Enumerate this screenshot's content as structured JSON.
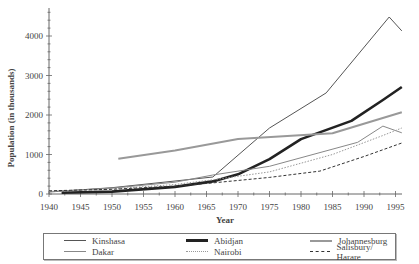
{
  "chart_data": {
    "type": "line",
    "title": "",
    "xlabel": "Year",
    "ylabel": "Population (in thousands)",
    "xlim": [
      1940,
      1996
    ],
    "ylim": [
      0,
      4650
    ],
    "xticks": [
      1940,
      1945,
      1950,
      1955,
      1960,
      1965,
      1970,
      1975,
      1980,
      1985,
      1990,
      1995
    ],
    "yticks": [
      0,
      1000,
      2000,
      3000,
      4000
    ],
    "grid": false,
    "legend_position": "bottom",
    "series": [
      {
        "name": "Kinshasa",
        "color": "#555555",
        "style": "solid-thin",
        "x": [
          1940,
          1950,
          1960,
          1966,
          1975,
          1984,
          1994,
          1996
        ],
        "y": [
          50,
          160,
          330,
          430,
          1670,
          2560,
          4480,
          4130
        ]
      },
      {
        "name": "Abidjan",
        "color": "#222222",
        "style": "solid-thick",
        "x": [
          1942,
          1950,
          1960,
          1966,
          1970,
          1975,
          1980,
          1988,
          1993,
          1996
        ],
        "y": [
          30,
          60,
          180,
          320,
          500,
          880,
          1390,
          1850,
          2380,
          2710
        ]
      },
      {
        "name": "Johannesburg",
        "color": "#999999",
        "style": "solid-medium",
        "x": [
          1951,
          1960,
          1970,
          1985,
          1996
        ],
        "y": [
          890,
          1100,
          1390,
          1540,
          2070
        ]
      },
      {
        "name": "Dakar",
        "color": "#888888",
        "style": "solid-thin",
        "x": [
          1940,
          1950,
          1960,
          1966,
          1975,
          1989,
          1993,
          1996
        ],
        "y": [
          60,
          150,
          300,
          480,
          700,
          1310,
          1720,
          1550
        ]
      },
      {
        "name": "Nairobi",
        "color": "#999999",
        "style": "dotted",
        "x": [
          1940,
          1950,
          1960,
          1966,
          1975,
          1985,
          1993,
          1996
        ],
        "y": [
          60,
          130,
          240,
          360,
          560,
          1000,
          1480,
          1670
        ]
      },
      {
        "name": "Salisbury/ Harare",
        "color": "#333333",
        "style": "dashed",
        "x": [
          1940,
          1950,
          1960,
          1966,
          1975,
          1983,
          1990,
          1996
        ],
        "y": [
          80,
          120,
          200,
          280,
          420,
          580,
          950,
          1290
        ]
      }
    ]
  },
  "legend": {
    "items": [
      {
        "label": "Kinshasa"
      },
      {
        "label": "Abidjan"
      },
      {
        "label": "Johannesburg"
      },
      {
        "label": "Dakar"
      },
      {
        "label": "Nairobi"
      },
      {
        "label": "Salisbury/ Harare"
      }
    ]
  }
}
